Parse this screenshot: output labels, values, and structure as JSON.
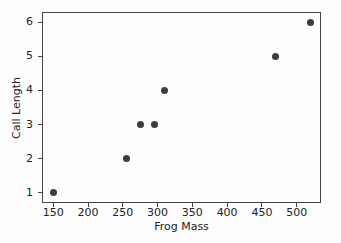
{
  "chart_data": {
    "type": "scatter",
    "title": "",
    "xlabel": "Frog Mass",
    "ylabel": "Call Length",
    "x": [
      150,
      255,
      275,
      295,
      310,
      470,
      520
    ],
    "y": [
      1,
      2,
      3,
      3,
      4,
      5,
      6
    ],
    "xticks": [
      150,
      200,
      250,
      300,
      350,
      400,
      450,
      500
    ],
    "yticks": [
      1,
      2,
      3,
      4,
      5,
      6
    ],
    "xlim": [
      133.75,
      535
    ],
    "ylim": [
      0.7,
      6.3
    ],
    "grid": false,
    "legend": null,
    "marker_color": "#3d3d3d",
    "axis_color": "#444444",
    "text_color": "#222222",
    "background_color": "#fdfdfd"
  }
}
